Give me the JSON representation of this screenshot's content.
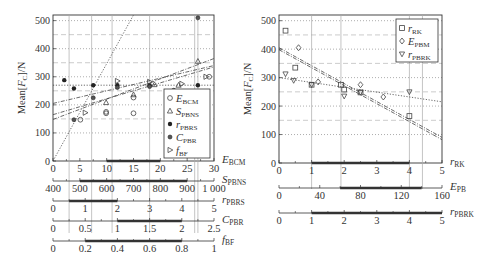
{
  "chart_data": [
    {
      "type": "scatter",
      "title": "",
      "ylabel": "Mean[F_C]/N",
      "ylim": [
        0,
        520
      ],
      "yticks": [
        0,
        100,
        200,
        300,
        400,
        500
      ],
      "grid": true,
      "legend_position": "lower right (inside)",
      "legend": [
        {
          "name": "E_BCM",
          "sub": "BCM",
          "base": "E",
          "marker": "circle"
        },
        {
          "name": "S_PBNS",
          "sub": "PBNS",
          "base": "S",
          "marker": "triangle"
        },
        {
          "name": "r_PBRS",
          "sub": "PBRS",
          "base": "r",
          "marker": "star"
        },
        {
          "name": "C_PBR",
          "sub": "PBR",
          "base": "C",
          "marker": "dot"
        },
        {
          "name": "f_BF",
          "sub": "BF",
          "base": "f",
          "marker": "triangle-right"
        }
      ],
      "axes": [
        {
          "label": "E_BCM",
          "base": "E",
          "sub": "BCM",
          "range": [
            0,
            30
          ],
          "ticks": [
            0,
            5,
            10,
            15,
            20,
            25,
            30
          ],
          "tick_labels": [
            "0",
            "5",
            "10",
            "15",
            "20",
            "25",
            "30"
          ],
          "highlight": [
            10,
            20
          ]
        },
        {
          "label": "S_PBNS",
          "base": "S",
          "sub": "PBNS",
          "range": [
            400,
            1000
          ],
          "ticks": [
            400,
            500,
            600,
            700,
            800,
            900,
            1000
          ],
          "tick_labels": [
            "400",
            "500",
            "600",
            "700",
            "800",
            "900",
            "1 000"
          ],
          "highlight": [
            500,
            900
          ]
        },
        {
          "label": "r_PBRS",
          "base": "r",
          "sub": "PBRS",
          "range": [
            0,
            5
          ],
          "ticks": [
            0,
            1,
            2,
            3,
            4,
            5
          ],
          "tick_labels": [
            "0",
            "1",
            "2",
            "3",
            "4",
            "5"
          ],
          "highlight": [
            0.5,
            2
          ]
        },
        {
          "label": "C_PBR",
          "base": "C",
          "sub": "PBR",
          "range": [
            0,
            2.5
          ],
          "ticks": [
            0,
            0.5,
            1,
            1.5,
            2,
            2.5
          ],
          "tick_labels": [
            "0",
            "0.5",
            "1",
            "1.5",
            "2",
            "2.5"
          ],
          "highlight": [
            1,
            2
          ]
        },
        {
          "label": "f_BF",
          "base": "f",
          "sub": "BF",
          "range": [
            0,
            1
          ],
          "ticks": [
            0,
            0.2,
            0.4,
            0.6,
            0.8,
            1
          ],
          "tick_labels": [
            "0",
            "0.2",
            "0.4",
            "0.6",
            "0.8",
            "1"
          ],
          "highlight": [
            0.2,
            0.8
          ]
        }
      ],
      "series": [
        {
          "name": "E_BCM",
          "marker": "circle",
          "points_frac": [
            [
              0.17,
              147
            ],
            [
              0.33,
              170
            ],
            [
              0.5,
              226
            ],
            [
              0.33,
              175
            ],
            [
              0.5,
              170
            ],
            [
              0.8,
              240
            ],
            [
              0.97,
              300
            ]
          ]
        },
        {
          "name": "S_PBNS",
          "marker": "triangle",
          "points_frac": [
            [
              0.33,
              208
            ],
            [
              0.5,
              236
            ],
            [
              0.63,
              272
            ],
            [
              0.78,
              270
            ],
            [
              0.9,
              355
            ],
            [
              0.88,
              230
            ]
          ]
        },
        {
          "name": "r_PBRS",
          "marker": "star",
          "points_frac": [
            [
              0.07,
              288
            ],
            [
              0.13,
              258
            ],
            [
              0.25,
              270
            ],
            [
              0.4,
              270
            ],
            [
              0.6,
              270
            ],
            [
              0.9,
              270
            ]
          ]
        },
        {
          "name": "C_PBR",
          "marker": "dot",
          "points_frac": [
            [
              0.13,
              147
            ],
            [
              0.25,
              225
            ],
            [
              0.4,
              262
            ],
            [
              0.6,
              265
            ],
            [
              0.75,
              252
            ],
            [
              0.9,
              510
            ]
          ]
        },
        {
          "name": "f_BF",
          "marker": "triangle-right",
          "points_frac": [
            [
              0.2,
              172
            ],
            [
              0.4,
              285
            ],
            [
              0.6,
              282
            ],
            [
              0.8,
              275
            ],
            [
              0.95,
              300
            ]
          ]
        }
      ],
      "fit_lines": [
        {
          "x0": 0,
          "y0": 0,
          "x1": 0.5,
          "y1": 520,
          "style": "dotted"
        },
        {
          "x0": 0,
          "y0": 148,
          "x1": 1,
          "y1": 365,
          "style": "dashdot"
        },
        {
          "x0": 0,
          "y0": 165,
          "x1": 1,
          "y1": 335,
          "style": "dashdot"
        },
        {
          "x0": 0,
          "y0": 205,
          "x1": 1,
          "y1": 340,
          "style": "dashdot"
        },
        {
          "x0": 0,
          "y0": 270,
          "x1": 1,
          "y1": 270,
          "style": "dotted"
        }
      ],
      "vertical_guides_frac": [
        0.1,
        0.24,
        0.367,
        0.6,
        0.88,
        0.9
      ]
    },
    {
      "type": "scatter",
      "title": "",
      "ylabel": "Mean[F_C]/N",
      "ylim": [
        0,
        520
      ],
      "yticks": [
        0,
        100,
        200,
        300,
        400,
        500
      ],
      "grid": true,
      "legend_position": "upper right (inside)",
      "legend": [
        {
          "name": "r_RK",
          "sub": "RK",
          "base": "r",
          "marker": "square"
        },
        {
          "name": "E_PBM",
          "sub": "PBM",
          "base": "E",
          "marker": "diamond"
        },
        {
          "name": "r_PBRK",
          "sub": "PBRK",
          "base": "r",
          "marker": "triangle-down"
        }
      ],
      "axes": [
        {
          "label": "r_RK",
          "base": "r",
          "sub": "RK",
          "range": [
            0,
            5
          ],
          "ticks": [
            0,
            1,
            2,
            3,
            4,
            5
          ],
          "tick_labels": [
            "0",
            "1",
            "2",
            "3",
            "4",
            "5"
          ],
          "highlight": [
            1,
            4
          ]
        },
        {
          "label": "E_PB",
          "base": "E",
          "sub": "PB",
          "range": [
            0,
            160
          ],
          "ticks": [
            0,
            40,
            80,
            120,
            160
          ],
          "tick_labels": [
            "0",
            "40",
            "80",
            "120",
            "160"
          ],
          "highlight": [
            60,
            140
          ]
        },
        {
          "label": "r_PBRK",
          "base": "r",
          "sub": "PBRK",
          "range": [
            0,
            5
          ],
          "ticks": [
            0,
            1,
            2,
            3,
            4,
            5
          ],
          "tick_labels": [
            "0",
            "1",
            "2",
            "3",
            "4",
            "5"
          ],
          "highlight": [
            1,
            5
          ]
        }
      ],
      "series": [
        {
          "name": "r_RK",
          "marker": "square",
          "points": [
            [
              0.2,
              465
            ],
            [
              0.5,
              335
            ],
            [
              1,
              275
            ],
            [
              1.9,
              275
            ],
            [
              2,
              258
            ],
            [
              2.5,
              248
            ],
            [
              4,
              165
            ]
          ]
        },
        {
          "name": "E_PBM",
          "marker": "diamond",
          "points": [
            [
              0.6,
              405
            ],
            [
              1.2,
              285
            ],
            [
              2.5,
              275
            ],
            [
              3.2,
              232
            ]
          ]
        },
        {
          "name": "r_PBRK",
          "marker": "triangle-down",
          "points": [
            [
              0.2,
              313
            ],
            [
              0.45,
              290
            ],
            [
              1,
              275
            ],
            [
              2,
              235
            ],
            [
              2.5,
              248
            ],
            [
              4,
              250
            ]
          ]
        }
      ],
      "fit_lines": [
        {
          "x0": 0,
          "y0": 405,
          "x1": 5,
          "y1": 90,
          "style": "dashdot"
        },
        {
          "x0": 0,
          "y0": 398,
          "x1": 5,
          "y1": 82,
          "style": "dashdot"
        },
        {
          "x0": 0,
          "y0": 300,
          "x1": 5,
          "y1": 215,
          "style": "dotted"
        }
      ],
      "vertical_guides": [
        1,
        1.9,
        4,
        4.4
      ]
    }
  ]
}
